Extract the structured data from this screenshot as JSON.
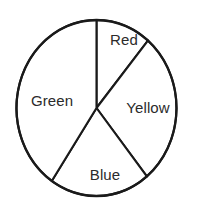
{
  "chart_data": {
    "type": "pie",
    "title": "",
    "subtitle": "",
    "xlabel": "",
    "ylabel": "",
    "grid": false,
    "legend_position": "none",
    "labels_inside_slices": true,
    "center_x": 96.5,
    "center_y": 108,
    "radius_x": 80,
    "radius_y": 88,
    "start_angle_deg": 0,
    "direction": "clockwise",
    "categories": [
      "Red",
      "Yellow",
      "Blue",
      "Green"
    ],
    "values": [
      11,
      28,
      20,
      41
    ],
    "slices": [
      {
        "label": "Red",
        "value": 11,
        "start_angle_deg": 0,
        "end_angle_deg": 40,
        "sweep_deg": 40,
        "fill": "#ffffff",
        "stroke": "#1a1a1a",
        "label_x": 124,
        "label_y": 41
      },
      {
        "label": "Yellow",
        "value": 28,
        "start_angle_deg": 40,
        "end_angle_deg": 141,
        "sweep_deg": 101,
        "fill": "#ffffff",
        "stroke": "#1a1a1a",
        "label_x": 148,
        "label_y": 109
      },
      {
        "label": "Blue",
        "value": 20,
        "start_angle_deg": 141,
        "end_angle_deg": 214,
        "sweep_deg": 73,
        "fill": "#ffffff",
        "stroke": "#1a1a1a",
        "label_x": 105,
        "label_y": 176
      },
      {
        "label": "Green",
        "value": 41,
        "start_angle_deg": 214,
        "end_angle_deg": 360,
        "sweep_deg": 146,
        "fill": "#ffffff",
        "stroke": "#1a1a1a",
        "label_x": 52,
        "label_y": 102
      }
    ],
    "colors": {
      "background": "#ffffff",
      "outline": "#1a1a1a",
      "label_text": "#2b2b2b"
    }
  }
}
